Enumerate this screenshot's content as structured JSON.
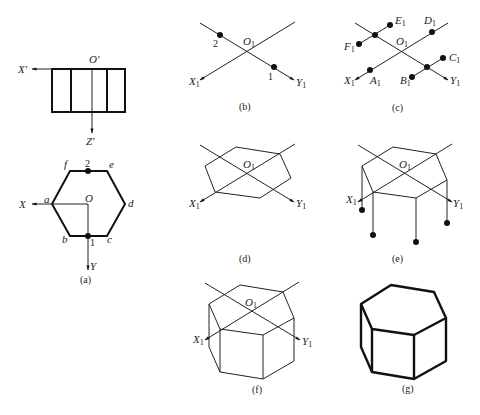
{
  "figure": {
    "panels": {
      "a": {
        "caption": "(a)",
        "front_view": {
          "origin": "O'",
          "x_axis": "X'",
          "z_axis": "Z'"
        },
        "top_view": {
          "origin": "O",
          "x_axis": "X",
          "y_axis": "Y",
          "vertices": [
            "a",
            "b",
            "c",
            "d",
            "e",
            "f"
          ],
          "points": [
            "1",
            "2"
          ]
        }
      },
      "b": {
        "caption": "(b)",
        "origin": "O",
        "origin_sub": "1",
        "x_axis": "X",
        "x_sub": "1",
        "y_axis": "Y",
        "y_sub": "1",
        "points": [
          "1",
          "2"
        ]
      },
      "c": {
        "caption": "(c)",
        "origin": "O",
        "origin_sub": "1",
        "x_axis": "X",
        "y_axis": "Y",
        "sub": "1",
        "points": [
          "A",
          "B",
          "C",
          "D",
          "E",
          "F"
        ]
      },
      "d": {
        "caption": "(d)",
        "origin": "O",
        "sub": "1",
        "x_axis": "X",
        "y_axis": "Y"
      },
      "e": {
        "caption": "(e)",
        "origin": "O",
        "sub": "1",
        "x_axis": "X",
        "y_axis": "Y"
      },
      "f": {
        "caption": "(f)",
        "origin": "O",
        "sub": "1",
        "x_axis": "X",
        "y_axis": "Y"
      },
      "g": {
        "caption": "(g)"
      }
    }
  }
}
